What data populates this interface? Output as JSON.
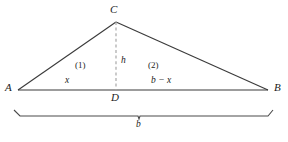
{
  "figure": {
    "type": "geometry-diagram",
    "background_color": "#ffffff",
    "stroke_color": "#3a3a3a",
    "dashed_stroke_color": "#a8a8a8",
    "brace_color": "#4a4a4a",
    "vertices": {
      "A": {
        "label": "A",
        "x": 18,
        "y": 90
      },
      "B": {
        "label": "B",
        "x": 268,
        "y": 90
      },
      "C": {
        "label": "C",
        "x": 116,
        "y": 22
      },
      "D": {
        "label": "D",
        "x": 116,
        "y": 90
      }
    },
    "vertex_labels": [
      {
        "name": "vertex-label-a",
        "text": "A",
        "x": 5,
        "y": 84
      },
      {
        "name": "vertex-label-b",
        "text": "B",
        "x": 274,
        "y": 84
      },
      {
        "name": "vertex-label-c",
        "text": "C",
        "x": 111,
        "y": 5
      },
      {
        "name": "vertex-label-d",
        "text": "D",
        "x": 112,
        "y": 93
      }
    ],
    "segment_labels": [
      {
        "name": "segment-label-x",
        "text": "x",
        "x": 65,
        "y": 76
      },
      {
        "name": "segment-label-b-minus-x",
        "text": "b − x",
        "x": 152,
        "y": 76
      },
      {
        "name": "segment-label-h",
        "text": "h",
        "x": 121,
        "y": 57
      }
    ],
    "region_labels": [
      {
        "name": "region-label-1",
        "text": "(1)",
        "x": 75,
        "y": 62
      },
      {
        "name": "region-label-2",
        "text": "(2)",
        "x": 148,
        "y": 62
      }
    ],
    "brace": {
      "name": "base-brace",
      "label": "b",
      "label_x": 139,
      "label_y": 126,
      "left_x": 20,
      "right_x": 268,
      "y": 116,
      "tick_height": 6
    }
  }
}
